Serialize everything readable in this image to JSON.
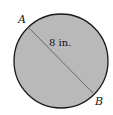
{
  "diagram": {
    "shape": "circle",
    "fill_color": "#b8b8b8",
    "stroke_color": "#1a1a1a",
    "points": [
      {
        "label": "A"
      },
      {
        "label": "B"
      }
    ],
    "segment_label": "8 in."
  }
}
